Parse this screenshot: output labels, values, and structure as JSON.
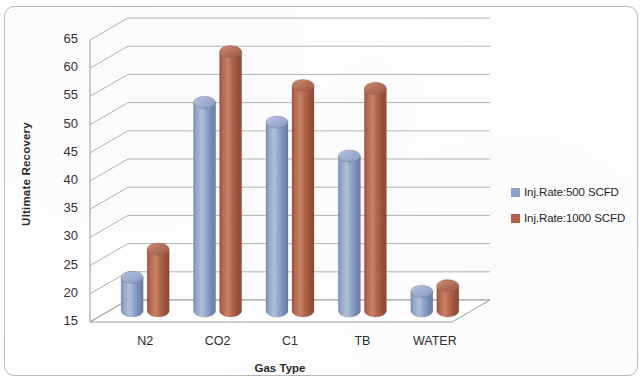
{
  "chart_data": {
    "type": "bar",
    "title": "",
    "subtitle": "",
    "xlabel": "Gas Type",
    "ylabel": "Ultimate Recovery",
    "categories": [
      "N2",
      "CO2",
      "C1",
      "TB",
      "WATER"
    ],
    "series": [
      {
        "name": "Inj.Rate:500 SCFD",
        "color": "#8AA3CC",
        "values": [
          21,
          52,
          48.5,
          42.5,
          18.5
        ]
      },
      {
        "name": "Inj.Rate:1000 SCFD",
        "color": "#B5604A",
        "values": [
          26,
          61,
          55,
          54.5,
          19.5
        ]
      }
    ],
    "ylim": [
      15,
      65
    ],
    "ytick_step": 5,
    "yticks": [
      15,
      20,
      25,
      30,
      35,
      40,
      45,
      50,
      55,
      60,
      65
    ],
    "ytick_labels": [
      "15",
      "20",
      "25",
      "30",
      "35",
      "40",
      "45",
      "50",
      "55",
      "60",
      "65"
    ],
    "grid": true,
    "grid_axis": "y",
    "legend_position": "right",
    "style": "3d-cylinder"
  },
  "colors": {
    "series_blue": "#8AA3CC",
    "series_red": "#B5604A",
    "gridline": "#9a9a9a",
    "frame_border": "#b9b9b9",
    "text": "#2b2b2b",
    "background": "#ffffff"
  }
}
